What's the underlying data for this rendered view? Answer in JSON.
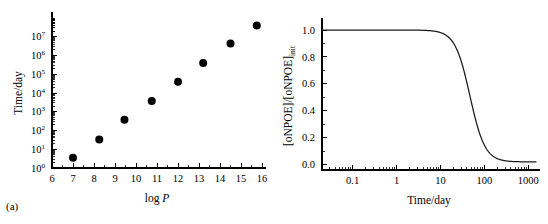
{
  "figure": {
    "panel_a_tag": "(a)",
    "panel_b_tag": "(b)"
  },
  "chart_data": [
    {
      "type": "scatter",
      "panel": "(a)",
      "title": "",
      "xlabel": "log P",
      "xlabel_italic_part": "P",
      "ylabel": "Time/day",
      "xlim": [
        6,
        16
      ],
      "ylim": [
        1,
        100000000
      ],
      "yscale": "log",
      "xscale": "linear",
      "grid": false,
      "legend": "none",
      "xticks": [
        6,
        7,
        8,
        9,
        10,
        11,
        12,
        13,
        14,
        15,
        16
      ],
      "xticklabels": [
        "6",
        "7",
        "8",
        "9",
        "10",
        "11",
        "12",
        "13",
        "14",
        "15",
        "16"
      ],
      "yticks": [
        1,
        10,
        100,
        1000,
        10000,
        100000,
        1000000,
        10000000
      ],
      "yticklabels": [
        "10⁰",
        "10¹",
        "10²",
        "10³",
        "10⁴",
        "10⁵",
        "10⁶",
        "10⁷"
      ],
      "ytick_mantissa": [
        "10",
        "10",
        "10",
        "10",
        "10",
        "10",
        "10",
        "10"
      ],
      "ytick_exponents": [
        "0",
        "1",
        "2",
        "3",
        "4",
        "5",
        "6",
        "7"
      ],
      "marker": "filled-circle",
      "marker_color": "#000000",
      "x": [
        7.0,
        8.25,
        9.45,
        10.75,
        12.0,
        13.2,
        14.5,
        15.75
      ],
      "y": [
        3.5,
        33,
        380,
        3700,
        40000,
        400000,
        4300000,
        40000000
      ]
    },
    {
      "type": "line",
      "panel": "(b)",
      "title": "",
      "xlabel": "Time/day",
      "ylabel": "[oNPOE]/[oNPOE]init",
      "ylabel_base": "[oNPOE]/[oNPOE]",
      "ylabel_subscript": "init",
      "xlim": [
        0.02,
        1500
      ],
      "ylim": [
        -0.04,
        1.06
      ],
      "xscale": "log",
      "yscale": "linear",
      "grid": false,
      "legend": "none",
      "xticks": [
        0.1,
        1,
        10,
        100,
        1000
      ],
      "xticklabels": [
        "0.1",
        "1",
        "10",
        "100",
        "1000"
      ],
      "yticks": [
        0.0,
        0.2,
        0.4,
        0.6,
        0.8,
        1.0
      ],
      "yticklabels": [
        "0.0",
        "0.2",
        "0.4",
        "0.6",
        "0.8",
        "1.0"
      ],
      "line_color": "#1a1a1a",
      "plateau_initial": 1.0,
      "plateau_final": 0.02,
      "midpoint_day": 47,
      "x": [
        0.02,
        0.05,
        0.1,
        0.2,
        0.5,
        1,
        2,
        3,
        5,
        7,
        10,
        14,
        20,
        28,
        35,
        42,
        47,
        55,
        65,
        80,
        100,
        130,
        170,
        220,
        300,
        450,
        700,
        1000,
        1500
      ],
      "y": [
        1.0,
        1.0,
        1.0,
        1.0,
        1.0,
        0.999,
        0.997,
        0.994,
        0.987,
        0.979,
        0.963,
        0.938,
        0.888,
        0.795,
        0.707,
        0.603,
        0.528,
        0.404,
        0.272,
        0.143,
        0.063,
        0.032,
        0.024,
        0.021,
        0.02,
        0.02,
        0.02,
        0.02,
        0.02
      ]
    }
  ]
}
